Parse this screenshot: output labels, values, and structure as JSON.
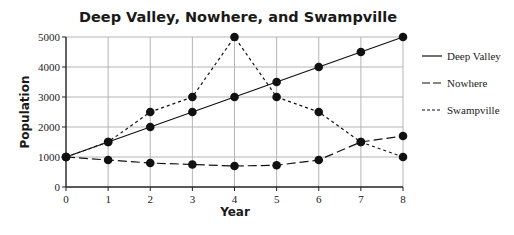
{
  "chart_data": {
    "type": "line",
    "title": "Deep Valley, Nowhere, and Swampville",
    "xlabel": "Year",
    "ylabel": "Population",
    "x": [
      0,
      1,
      2,
      3,
      4,
      5,
      6,
      7,
      8
    ],
    "xlim": [
      0,
      8
    ],
    "ylim": [
      0,
      5000
    ],
    "yticks": [
      0,
      1000,
      2000,
      3000,
      4000,
      5000
    ],
    "xticks": [
      0,
      1,
      2,
      3,
      4,
      5,
      6,
      7,
      8
    ],
    "grid": true,
    "legend_position": "right",
    "series": [
      {
        "name": "Deep Valley",
        "style": "solid",
        "values": [
          1000,
          1500,
          2000,
          2500,
          3000,
          3500,
          4000,
          4500,
          5000
        ]
      },
      {
        "name": "Nowhere",
        "style": "long-dash",
        "values": [
          1000,
          900,
          800,
          750,
          700,
          725,
          900,
          1500,
          1700
        ]
      },
      {
        "name": "Swampville",
        "style": "short-dash",
        "values": [
          1000,
          1500,
          2500,
          3000,
          5000,
          3000,
          2500,
          1500,
          1000
        ]
      }
    ]
  },
  "colors": {
    "line": "#111111",
    "grid": "#b5b5b5",
    "axis": "#222222"
  }
}
